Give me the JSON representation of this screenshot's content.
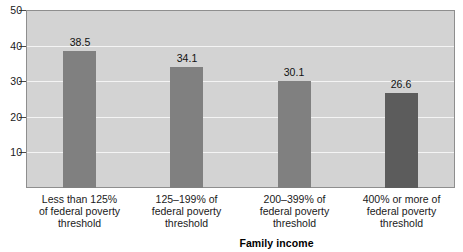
{
  "chart_data": {
    "type": "bar",
    "title": "",
    "subtitle": "",
    "xlabel": "Family income",
    "ylabel": "",
    "ylim": [
      0,
      50
    ],
    "yticks": [
      10,
      20,
      30,
      40,
      50
    ],
    "ytick_labels": [
      "10",
      "20",
      "30",
      "40",
      "50"
    ],
    "grid": "horizontal",
    "legend": "none",
    "categories": [
      "Less than 125% of federal poverty threshold",
      "125–199% of federal poverty threshold",
      "200–399% of federal poverty threshold",
      "400% or more of federal poverty threshold"
    ],
    "category_lines": [
      [
        "Less than 125%",
        "of federal poverty",
        "threshold"
      ],
      [
        "125–199% of",
        "federal poverty",
        "threshold"
      ],
      [
        "200–399% of",
        "federal poverty",
        "threshold"
      ],
      [
        "400% or more of",
        "federal poverty",
        "threshold"
      ]
    ],
    "values": [
      38.5,
      34.1,
      30.1,
      26.6
    ],
    "value_labels": [
      "38.5",
      "34.1",
      "30.1",
      "26.6"
    ],
    "bar_colors": [
      "#808080",
      "#808080",
      "#808080",
      "#5c5c5c"
    ],
    "plot_background": "#d3d3d3",
    "gridline_color": "#f4f4f4",
    "axis_color": "#8e8e8e"
  },
  "axis": {
    "x_title": "Family income"
  }
}
